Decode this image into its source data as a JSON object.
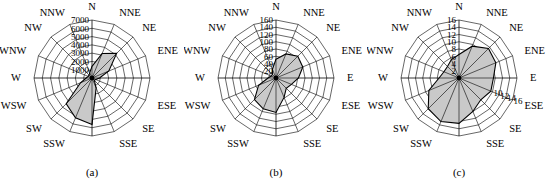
{
  "figure": {
    "type": "wind-rose-triptych",
    "background": "#ffffff",
    "fill_color": "#c9c9c9",
    "line_color": "#000000"
  },
  "directions": [
    "N",
    "NNE",
    "NE",
    "ENE",
    "E",
    "ESE",
    "SE",
    "SSE",
    "S",
    "SSW",
    "SW",
    "WSW",
    "W",
    "WNW",
    "NW",
    "NNW"
  ],
  "panels": [
    {
      "caption": "(a)",
      "tick_labels": [
        "1000",
        "2000",
        "3000",
        "4000",
        "5000",
        "6000",
        "7000"
      ],
      "tick_axis": "N",
      "secondary_tick_labels": [],
      "rmax": 7000,
      "rings": 7,
      "values": [
        1400,
        3200,
        4200,
        2200,
        900,
        500,
        400,
        1300,
        5600,
        5200,
        4400,
        1500,
        700,
        500,
        500,
        700
      ],
      "direction_labels": [
        "N",
        "NNE",
        "NE",
        "ENE",
        "ESE",
        "SE",
        "SSE",
        "SSW",
        "SW",
        "WSW",
        "W",
        "WNW",
        "NW",
        "NNW"
      ]
    },
    {
      "caption": "(b)",
      "tick_labels": [
        "20",
        "40",
        "60",
        "80",
        "100",
        "120",
        "140",
        "160"
      ],
      "tick_axis": "N",
      "secondary_tick_labels": [],
      "rmax": 160,
      "rings": 8,
      "values": [
        52,
        72,
        85,
        80,
        62,
        46,
        40,
        58,
        95,
        92,
        84,
        52,
        22,
        14,
        14,
        26
      ],
      "direction_labels": [
        "N",
        "NNE",
        "NE",
        "ENE",
        "E",
        "ESE",
        "SE",
        "SSE",
        "SSW",
        "SW",
        "WSW",
        "W",
        "WNW",
        "NW",
        "NNW"
      ]
    },
    {
      "caption": "(c)",
      "tick_labels": [
        "2",
        "4",
        "6",
        "8",
        "10",
        "12",
        "14",
        "16"
      ],
      "tick_axis": "N",
      "secondary_tick_labels": [
        "10",
        "12",
        "14",
        "16"
      ],
      "secondary_tick_axis": "ESE",
      "rmax": 16,
      "rings": 8,
      "values": [
        6.5,
        9.5,
        11.5,
        11.0,
        9.5,
        9.5,
        8.5,
        10.0,
        12.5,
        13.0,
        12.0,
        9.0,
        5.5,
        4.5,
        4.5,
        5.5
      ],
      "direction_labels": [
        "N",
        "NNE",
        "NE",
        "ENE",
        "E",
        "ESE",
        "SE",
        "SSE",
        "SSW",
        "SW",
        "WSW",
        "W",
        "WNW",
        "NW",
        "NNW"
      ]
    }
  ],
  "chart_data": {
    "type": "radar",
    "title": "",
    "subplots": [
      {
        "label": "(a)",
        "categories": [
          "N",
          "NNE",
          "NE",
          "ENE",
          "E",
          "ESE",
          "SE",
          "SSE",
          "S",
          "SSW",
          "SW",
          "WSW",
          "W",
          "WNW",
          "NW",
          "NNW"
        ],
        "values": [
          1400,
          3200,
          4200,
          2200,
          900,
          500,
          400,
          1300,
          5600,
          5200,
          4400,
          1500,
          700,
          500,
          500,
          700
        ],
        "rlim": [
          0,
          7000
        ],
        "rticks": [
          1000,
          2000,
          3000,
          4000,
          5000,
          6000,
          7000
        ],
        "grid": true,
        "legend": "none"
      },
      {
        "label": "(b)",
        "categories": [
          "N",
          "NNE",
          "NE",
          "ENE",
          "E",
          "ESE",
          "SE",
          "SSE",
          "S",
          "SSW",
          "SW",
          "WSW",
          "W",
          "WNW",
          "NW",
          "NNW"
        ],
        "values": [
          52,
          72,
          85,
          80,
          62,
          46,
          40,
          58,
          95,
          92,
          84,
          52,
          22,
          14,
          14,
          26
        ],
        "rlim": [
          0,
          160
        ],
        "rticks": [
          20,
          40,
          60,
          80,
          100,
          120,
          140,
          160
        ],
        "grid": true,
        "legend": "none"
      },
      {
        "label": "(c)",
        "categories": [
          "N",
          "NNE",
          "NE",
          "ENE",
          "E",
          "ESE",
          "SE",
          "SSE",
          "S",
          "SSW",
          "SW",
          "WSW",
          "W",
          "WNW",
          "NW",
          "NNW"
        ],
        "values": [
          6.5,
          9.5,
          11.5,
          11.0,
          9.5,
          9.5,
          8.5,
          10.0,
          12.5,
          13.0,
          12.0,
          9.0,
          5.5,
          4.5,
          4.5,
          5.5
        ],
        "rlim": [
          0,
          16
        ],
        "rticks": [
          2,
          4,
          6,
          8,
          10,
          12,
          14,
          16
        ],
        "grid": true,
        "legend": "none"
      }
    ]
  }
}
